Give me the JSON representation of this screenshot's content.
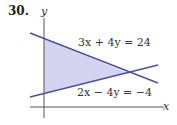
{
  "problem_number": "30.",
  "axes": {
    "x_label": "x",
    "y_label": "y"
  },
  "equations": {
    "line1": "3x + 4y = 24",
    "line2": "2x − 4y = −4"
  },
  "colors": {
    "line": "#4a4fa8",
    "fill": "#d4d4f0",
    "axis": "#555555"
  }
}
